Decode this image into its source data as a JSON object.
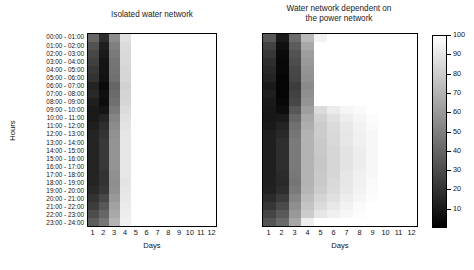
{
  "figure": {
    "background": "#ffffff",
    "ink": "#111111"
  },
  "axes": {
    "ylabel": "Hours",
    "xlabel": "Days",
    "hour_ticks": [
      "00:00 - 01:00",
      "01:00 - 02:00",
      "02:00 - 03:00",
      "03:00 - 04:00",
      "04:00 - 05:00",
      "05:00 - 06:00",
      "06:00 - 07:00",
      "07:00 - 08:00",
      "08:00 - 09:00",
      "09:00 - 10:00",
      "10:00 - 11:00",
      "11:00 - 12:00",
      "12:00 - 13:00",
      "13:00 - 14:00",
      "14:00 - 15:00",
      "15:00 - 16:00",
      "16:00 - 17:00",
      "17:00 - 18:00",
      "18:00 - 19:00",
      "19:00 - 20:00",
      "20:00 - 21:00",
      "21:00 - 22:00",
      "22:00 - 23:00",
      "23:00 - 24:00"
    ],
    "day_ticks": [
      "1",
      "2",
      "3",
      "4",
      "5",
      "6",
      "7",
      "8",
      "9",
      "10",
      "11",
      "12"
    ]
  },
  "colorbar": {
    "min": 0,
    "max": 100,
    "low_color": "#000000",
    "high_color": "#ffffff",
    "orientation": "vertical",
    "ticks": [
      "100",
      "90",
      "80",
      "70",
      "60",
      "50",
      "40",
      "30",
      "20",
      "10"
    ],
    "tick_values": [
      100,
      90,
      80,
      70,
      60,
      50,
      40,
      30,
      20,
      10
    ]
  },
  "chart_data": [
    {
      "type": "heatmap",
      "title": "Isolated water network",
      "xlabel": "Days",
      "ylabel": "Hours",
      "x": [
        "1",
        "2",
        "3",
        "4",
        "5",
        "6",
        "7",
        "8",
        "9",
        "10",
        "11",
        "12"
      ],
      "y": [
        "00:00 - 01:00",
        "01:00 - 02:00",
        "02:00 - 03:00",
        "03:00 - 04:00",
        "04:00 - 05:00",
        "05:00 - 06:00",
        "06:00 - 07:00",
        "07:00 - 08:00",
        "08:00 - 09:00",
        "09:00 - 10:00",
        "10:00 - 11:00",
        "11:00 - 12:00",
        "12:00 - 13:00",
        "13:00 - 14:00",
        "14:00 - 15:00",
        "15:00 - 16:00",
        "16:00 - 17:00",
        "17:00 - 18:00",
        "18:00 - 19:00",
        "19:00 - 20:00",
        "20:00 - 21:00",
        "21:00 - 22:00",
        "22:00 - 23:00",
        "23:00 - 24:00"
      ],
      "zmin": 0,
      "zmax": 100,
      "colormap": "gray",
      "values": [
        [
          40,
          18,
          55,
          88,
          100,
          100,
          100,
          100,
          100,
          100,
          100,
          100
        ],
        [
          32,
          12,
          50,
          86,
          100,
          100,
          100,
          100,
          100,
          100,
          100,
          100
        ],
        [
          28,
          10,
          48,
          85,
          100,
          100,
          100,
          100,
          100,
          100,
          100,
          100
        ],
        [
          25,
          8,
          46,
          85,
          100,
          100,
          100,
          100,
          100,
          100,
          100,
          100
        ],
        [
          22,
          8,
          45,
          84,
          100,
          100,
          100,
          100,
          100,
          100,
          100,
          100
        ],
        [
          20,
          7,
          44,
          84,
          100,
          100,
          100,
          100,
          100,
          100,
          100,
          100
        ],
        [
          14,
          4,
          40,
          82,
          100,
          100,
          100,
          100,
          100,
          100,
          100,
          100
        ],
        [
          16,
          6,
          42,
          83,
          100,
          100,
          100,
          100,
          100,
          100,
          100,
          100
        ],
        [
          12,
          5,
          44,
          84,
          100,
          100,
          100,
          100,
          100,
          100,
          100,
          100
        ],
        [
          10,
          8,
          48,
          86,
          100,
          100,
          100,
          100,
          100,
          100,
          100,
          100
        ],
        [
          10,
          14,
          52,
          88,
          100,
          100,
          100,
          100,
          100,
          100,
          100,
          100
        ],
        [
          12,
          18,
          55,
          89,
          100,
          100,
          100,
          100,
          100,
          100,
          100,
          100
        ],
        [
          14,
          20,
          57,
          90,
          100,
          100,
          100,
          100,
          100,
          100,
          100,
          100
        ],
        [
          14,
          22,
          58,
          90,
          100,
          100,
          100,
          100,
          100,
          100,
          100,
          100
        ],
        [
          14,
          22,
          58,
          90,
          100,
          100,
          100,
          100,
          100,
          100,
          100,
          100
        ],
        [
          14,
          22,
          58,
          90,
          100,
          100,
          100,
          100,
          100,
          100,
          100,
          100
        ],
        [
          14,
          22,
          58,
          90,
          100,
          100,
          100,
          100,
          100,
          100,
          100,
          100
        ],
        [
          14,
          20,
          57,
          90,
          100,
          100,
          100,
          100,
          100,
          100,
          100,
          100
        ],
        [
          14,
          20,
          56,
          89,
          100,
          100,
          100,
          100,
          100,
          100,
          100,
          100
        ],
        [
          16,
          22,
          57,
          90,
          100,
          100,
          100,
          100,
          100,
          100,
          100,
          100
        ],
        [
          20,
          28,
          60,
          91,
          100,
          100,
          100,
          100,
          100,
          100,
          100,
          100
        ],
        [
          24,
          34,
          63,
          92,
          100,
          100,
          100,
          100,
          100,
          100,
          100,
          100
        ],
        [
          30,
          40,
          66,
          93,
          100,
          100,
          100,
          100,
          100,
          100,
          100,
          100
        ],
        [
          36,
          46,
          70,
          94,
          100,
          100,
          100,
          100,
          100,
          100,
          100,
          100
        ]
      ]
    },
    {
      "type": "heatmap",
      "title": "Water network dependent on the power network",
      "title_line1": "Water network dependent on",
      "title_line2": "the power network",
      "xlabel": "Days",
      "ylabel": "Hours",
      "x": [
        "1",
        "2",
        "3",
        "4",
        "5",
        "6",
        "7",
        "8",
        "9",
        "10",
        "11",
        "12"
      ],
      "y": [
        "00:00 - 01:00",
        "01:00 - 02:00",
        "02:00 - 03:00",
        "03:00 - 04:00",
        "04:00 - 05:00",
        "05:00 - 06:00",
        "06:00 - 07:00",
        "07:00 - 08:00",
        "08:00 - 09:00",
        "09:00 - 10:00",
        "10:00 - 11:00",
        "11:00 - 12:00",
        "12:00 - 13:00",
        "13:00 - 14:00",
        "14:00 - 15:00",
        "15:00 - 16:00",
        "16:00 - 17:00",
        "17:00 - 18:00",
        "18:00 - 19:00",
        "19:00 - 20:00",
        "20:00 - 21:00",
        "21:00 - 22:00",
        "22:00 - 23:00",
        "23:00 - 24:00"
      ],
      "zmin": 0,
      "zmax": 100,
      "colormap": "gray",
      "values": [
        [
          34,
          10,
          42,
          72,
          95,
          100,
          100,
          100,
          100,
          100,
          100,
          100
        ],
        [
          26,
          6,
          36,
          66,
          100,
          100,
          100,
          100,
          100,
          100,
          100,
          100
        ],
        [
          22,
          4,
          32,
          62,
          100,
          100,
          100,
          100,
          100,
          100,
          100,
          100
        ],
        [
          18,
          3,
          30,
          60,
          100,
          100,
          100,
          100,
          100,
          100,
          100,
          100
        ],
        [
          16,
          3,
          28,
          58,
          100,
          100,
          100,
          100,
          100,
          100,
          100,
          100
        ],
        [
          14,
          2,
          27,
          57,
          100,
          100,
          100,
          100,
          100,
          100,
          100,
          100
        ],
        [
          10,
          2,
          24,
          54,
          100,
          100,
          100,
          100,
          100,
          100,
          100,
          100
        ],
        [
          12,
          2,
          26,
          56,
          100,
          100,
          100,
          100,
          100,
          100,
          100,
          100
        ],
        [
          10,
          3,
          28,
          58,
          100,
          100,
          100,
          100,
          100,
          100,
          100,
          100
        ],
        [
          9,
          5,
          34,
          62,
          86,
          92,
          96,
          98,
          100,
          100,
          100,
          100
        ],
        [
          9,
          10,
          40,
          66,
          82,
          88,
          93,
          96,
          99,
          100,
          100,
          100
        ],
        [
          10,
          14,
          44,
          68,
          80,
          86,
          91,
          95,
          98,
          100,
          100,
          100
        ],
        [
          12,
          16,
          46,
          70,
          80,
          85,
          90,
          94,
          97,
          100,
          100,
          100
        ],
        [
          12,
          18,
          48,
          70,
          79,
          85,
          90,
          94,
          97,
          100,
          100,
          100
        ],
        [
          12,
          18,
          48,
          70,
          79,
          84,
          89,
          93,
          97,
          100,
          100,
          100
        ],
        [
          12,
          18,
          48,
          70,
          78,
          84,
          89,
          93,
          97,
          100,
          100,
          100
        ],
        [
          12,
          18,
          48,
          70,
          78,
          84,
          89,
          93,
          97,
          100,
          100,
          100
        ],
        [
          12,
          17,
          47,
          70,
          79,
          84,
          90,
          94,
          97,
          100,
          100,
          100
        ],
        [
          12,
          16,
          46,
          70,
          79,
          85,
          90,
          94,
          98,
          100,
          100,
          100
        ],
        [
          13,
          18,
          48,
          71,
          80,
          86,
          91,
          95,
          98,
          100,
          100,
          100
        ],
        [
          17,
          23,
          52,
          74,
          83,
          88,
          93,
          96,
          99,
          100,
          100,
          100
        ],
        [
          21,
          29,
          56,
          77,
          86,
          91,
          95,
          98,
          100,
          100,
          100,
          100
        ],
        [
          27,
          35,
          60,
          80,
          90,
          94,
          97,
          99,
          100,
          100,
          100,
          100
        ],
        [
          33,
          41,
          65,
          93,
          100,
          100,
          100,
          100,
          100,
          100,
          100,
          100
        ]
      ]
    }
  ]
}
